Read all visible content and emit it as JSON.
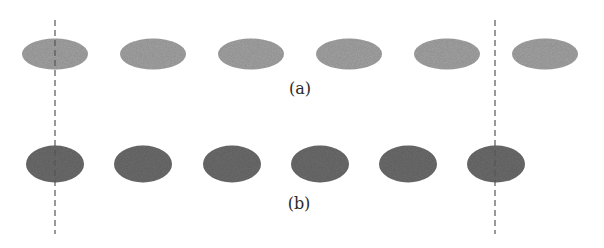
{
  "figure": {
    "width": 604,
    "height": 248,
    "background": "#ffffff"
  },
  "rows": [
    {
      "id": "a",
      "label": "(a)",
      "label_pos": {
        "x": 300,
        "y": 88
      },
      "color": "#a6a6a6",
      "cy": 54,
      "rx": 33,
      "ry": 15.5,
      "ellipse_centers_x": [
        55,
        153,
        251,
        349,
        447,
        545
      ]
    },
    {
      "id": "b",
      "label": "(b)",
      "label_pos": {
        "x": 299,
        "y": 203
      },
      "color": "#6e6e6e",
      "cy": 164,
      "rx": 29,
      "ry": 18.5,
      "ellipse_centers_x": [
        55,
        143,
        232,
        320,
        408,
        496
      ]
    }
  ],
  "reference_lines": [
    {
      "x": 55,
      "y1": 20,
      "y2": 234,
      "color": "#555555",
      "style": "dashed"
    },
    {
      "x": 495,
      "y1": 20,
      "y2": 234,
      "color": "#555555",
      "style": "dashed"
    }
  ]
}
